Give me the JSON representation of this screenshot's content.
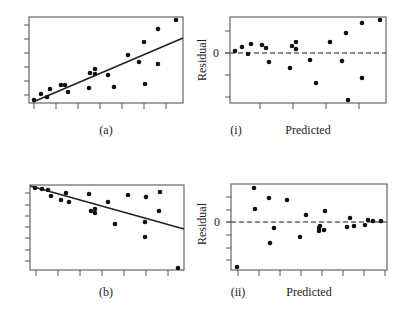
{
  "figure": {
    "panels": [
      {
        "id": "a",
        "label": "(a)",
        "kind": "scatter-fit"
      },
      {
        "id": "i",
        "label": "(i)",
        "kind": "residual",
        "xlabel": "Predicted",
        "ylabel": "Residual",
        "zero_tick": "0"
      },
      {
        "id": "b",
        "label": "(b)",
        "kind": "scatter-fit"
      },
      {
        "id": "ii",
        "label": "(ii)",
        "kind": "residual",
        "xlabel": "Predicted",
        "ylabel": "Residual",
        "zero_tick": "0"
      }
    ]
  },
  "chart_data": [
    {
      "type": "scatter",
      "title": "(a)",
      "xlabel": "",
      "ylabel": "",
      "grid": false,
      "box": [
        29,
        17,
        183,
        103
      ],
      "xticks": [
        34,
        56,
        78,
        100,
        122,
        144,
        166
      ],
      "yticks": [
        95,
        81,
        67,
        53,
        39,
        25
      ],
      "points": [
        [
          34,
          100
        ],
        [
          41,
          94
        ],
        [
          47,
          97
        ],
        [
          50,
          89
        ],
        [
          61,
          85
        ],
        [
          65,
          85
        ],
        [
          68,
          92
        ],
        [
          89,
          88
        ],
        [
          90,
          73
        ],
        [
          95,
          69
        ],
        [
          95,
          74
        ],
        [
          108,
          75
        ],
        [
          114,
          87
        ],
        [
          128,
          55
        ],
        [
          139,
          62
        ],
        [
          144,
          42
        ],
        [
          145,
          84
        ],
        [
          158,
          64
        ],
        [
          158,
          29
        ],
        [
          176,
          20
        ]
      ],
      "fit_line": [
        [
          33,
          102
        ],
        [
          183,
          38
        ]
      ]
    },
    {
      "type": "scatter",
      "title": "(i)",
      "xlabel": "Predicted",
      "ylabel": "Residual",
      "grid": false,
      "box": [
        230,
        17,
        386,
        103
      ],
      "zero_y": 53,
      "xticks": [
        260,
        293,
        326,
        359
      ],
      "yticks": [
        31,
        53,
        75,
        97
      ],
      "points": [
        [
          235,
          51
        ],
        [
          242,
          47
        ],
        [
          248,
          54
        ],
        [
          251,
          44
        ],
        [
          262,
          45
        ],
        [
          266,
          48
        ],
        [
          269,
          62
        ],
        [
          290,
          68
        ],
        [
          292,
          46
        ],
        [
          296,
          42
        ],
        [
          296,
          49
        ],
        [
          310,
          60
        ],
        [
          316,
          83
        ],
        [
          330,
          42
        ],
        [
          342,
          61
        ],
        [
          346,
          33
        ],
        [
          348,
          100
        ],
        [
          362,
          78
        ],
        [
          362,
          23
        ],
        [
          380,
          20
        ]
      ]
    },
    {
      "type": "scatter",
      "title": "(b)",
      "xlabel": "",
      "ylabel": "",
      "grid": false,
      "box": [
        30,
        185,
        184,
        270
      ],
      "xticks": [
        36,
        58,
        80,
        102,
        124,
        146,
        168
      ],
      "yticks": [
        193,
        205,
        216,
        227,
        238,
        250,
        261
      ],
      "points": [
        [
          35,
          188
        ],
        [
          42,
          189
        ],
        [
          48,
          190
        ],
        [
          51,
          196
        ],
        [
          61,
          200
        ],
        [
          66,
          193
        ],
        [
          69,
          202
        ],
        [
          89,
          194
        ],
        [
          91,
          211
        ],
        [
          95,
          209
        ],
        [
          95,
          213
        ],
        [
          108,
          202
        ],
        [
          115,
          224
        ],
        [
          128,
          195
        ],
        [
          145,
          222
        ],
        [
          145,
          237
        ],
        [
          146,
          197
        ],
        [
          159,
          211
        ],
        [
          160,
          192
        ],
        [
          178,
          268
        ]
      ],
      "fit_line": [
        [
          30,
          186
        ],
        [
          184,
          229
        ]
      ]
    },
    {
      "type": "scatter",
      "title": "(ii)",
      "xlabel": "Predicted",
      "ylabel": "Residual",
      "grid": false,
      "box": [
        231,
        184,
        387,
        270
      ],
      "zero_y": 222,
      "xticks": [
        238,
        259,
        280,
        301,
        322,
        343,
        364,
        385
      ],
      "yticks": [
        197,
        210,
        222,
        235,
        248,
        260
      ],
      "points": [
        [
          237,
          267
        ],
        [
          254,
          188
        ],
        [
          255,
          209
        ],
        [
          269,
          198
        ],
        [
          270,
          243
        ],
        [
          274,
          228
        ],
        [
          287,
          200
        ],
        [
          300,
          237
        ],
        [
          306,
          215
        ],
        [
          319,
          228
        ],
        [
          319,
          231
        ],
        [
          320,
          226
        ],
        [
          324,
          230
        ],
        [
          325,
          211
        ],
        [
          347,
          227
        ],
        [
          350,
          218
        ],
        [
          354,
          226
        ],
        [
          365,
          225
        ],
        [
          368,
          220
        ],
        [
          373,
          221
        ],
        [
          381,
          221
        ]
      ]
    }
  ]
}
